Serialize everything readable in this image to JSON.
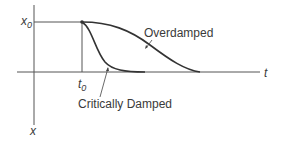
{
  "diagram": {
    "axes": {
      "horizontal_label": "t",
      "vertical_label": "x"
    },
    "markers": {
      "x0_label": "x",
      "x0_sub": "0",
      "t0_label": "t",
      "t0_sub": "0"
    },
    "curves": [
      {
        "name": "Overdamped",
        "label": "Overdamped"
      },
      {
        "name": "Critically Damped",
        "label": "Critically Damped"
      }
    ],
    "colors": {
      "line": "#3a3a3a",
      "curve": "#333333"
    }
  }
}
